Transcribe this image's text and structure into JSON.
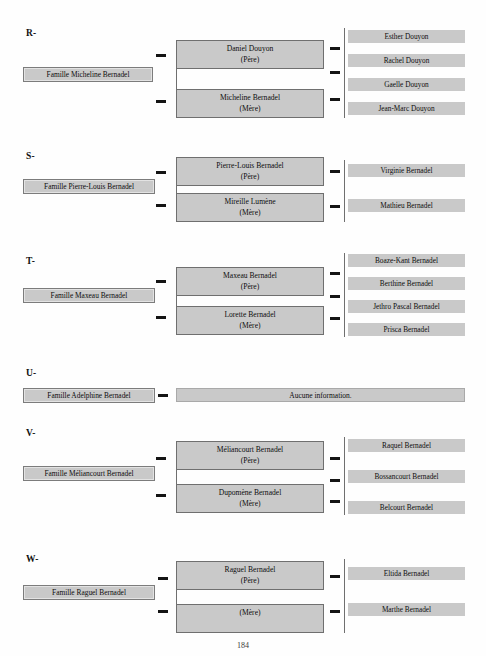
{
  "document": {
    "page_number": "184",
    "no_info_label": "Aucune information.",
    "father_role": "(Père)",
    "mother_role": "(Mère)",
    "colors": {
      "box_fill": "#c9c9c9",
      "box_border": "#6f6f6f",
      "text": "#0d0d0d",
      "page_background": "#ffffff"
    }
  },
  "sections": [
    {
      "letter": "R-",
      "family_label": "Famille Micheline Bernadel",
      "father": {
        "name": "Daniel Douyon",
        "role": "(Père)"
      },
      "mother": {
        "name": "Micheline Bernadel",
        "role": "(Mère)"
      },
      "children": [
        "Esther Douyon",
        "Rachel Douyon",
        "Gaelle Douyon",
        "Jean-Marc Douyon"
      ]
    },
    {
      "letter": "S-",
      "family_label": "Famille Pierre-Louis Bernadel",
      "father": {
        "name": "Pierre-Louis Bernadel",
        "role": "(Père)"
      },
      "mother": {
        "name": "Mireille Lumène",
        "role": "(Mère)"
      },
      "children": [
        "Virginie Bernadel",
        "Mathieu Bernadel"
      ]
    },
    {
      "letter": "T-",
      "family_label": "Famille Maxeau Bernadel",
      "father": {
        "name": "Maxeau Bernadel",
        "role": "(Père)"
      },
      "mother": {
        "name": "Lorette Bernadel",
        "role": "(Mère)"
      },
      "children": [
        "Boaze-Kant Bernadel",
        "Berthine Bernadel",
        "Jethro Pascal Bernadel",
        "Prisca Bernadel"
      ]
    },
    {
      "letter": "U-",
      "family_label": "Famille Adelphine Bernadel",
      "no_information": "Aucune information.",
      "children": []
    },
    {
      "letter": "V-",
      "family_label": "Famille Méliancourt Bernadel",
      "father": {
        "name": "Méliancourt Bernadel",
        "role": "(Père)"
      },
      "mother": {
        "name": "Dupomène Bernadel",
        "role": "(Mère)"
      },
      "children": [
        "Raquel Bernadel",
        "Bossancourt Bernadel",
        "Belcourt Bernadel"
      ]
    },
    {
      "letter": "W-",
      "family_label": "Famille Raguel Bernadel",
      "father": {
        "name": "Raguel Bernadel",
        "role": "(Père)"
      },
      "mother": {
        "name": "",
        "role": "(Mère)"
      },
      "children": [
        "Eltida Bernadel",
        "Marthe Bernadel"
      ]
    }
  ]
}
